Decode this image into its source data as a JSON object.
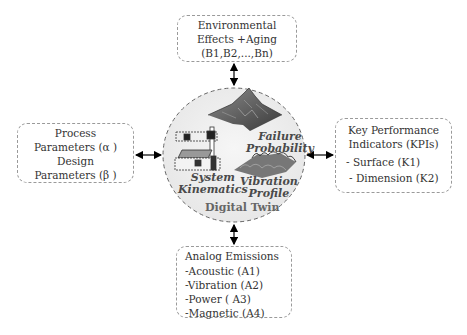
{
  "diagram": {
    "center": {
      "title": "Digital Twin",
      "labels": {
        "failure": [
          "Failure",
          "Probability"
        ],
        "kinematics": [
          "System",
          "Kinematics"
        ],
        "vibration": [
          "Vibration",
          "Profile"
        ]
      },
      "icons": [
        "surface-plot-icon",
        "gantry-machine-icon",
        "vibration-surface-icon"
      ]
    },
    "top": {
      "lines": [
        "Environmental",
        "Effects +Aging",
        "(B1,B2,...,Bn)"
      ]
    },
    "left": {
      "lines": [
        "Process",
        "Parameters (α )",
        "Design",
        "Parameters (β )"
      ]
    },
    "right": {
      "header": [
        "Key Performance",
        "Indicators (KPIs)"
      ],
      "items": [
        "- Surface (K1)",
        "- Dimension (K2)"
      ]
    },
    "bottom": {
      "header": "Analog Emissions",
      "items": [
        "-Acoustic (A1)",
        "-Vibration (A2)",
        "-Power ( A3)",
        "-Magnetic (A4)"
      ]
    },
    "colors": {
      "border": "#9a9a9a",
      "circle_fill": "#eeeeee",
      "text": "#333333",
      "arrow": "#000000"
    }
  }
}
